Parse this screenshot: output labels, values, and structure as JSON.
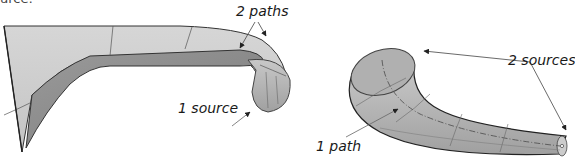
{
  "caption_fragment": "urce:",
  "figures": [
    {
      "name": "sweep-2-paths-1-source",
      "labels": {
        "paths": "2 paths",
        "source": "1 source"
      }
    },
    {
      "name": "sweep-1-path-2-sources",
      "labels": {
        "sources": "2 sources",
        "path": "1 path"
      }
    }
  ],
  "colors": {
    "surface_light": "#d2d2d2",
    "surface_mid": "#b4b4b4",
    "surface_dark": "#8e8e8e",
    "edge": "#333333",
    "arrow": "#222222"
  }
}
